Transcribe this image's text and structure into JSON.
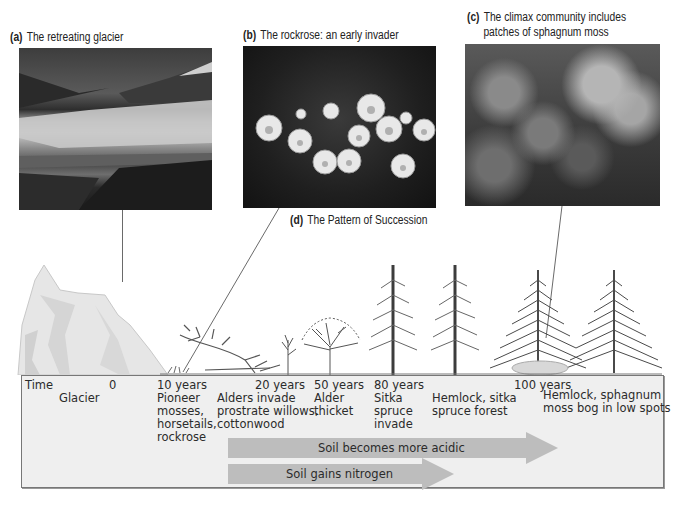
{
  "figure": {
    "panels": [
      {
        "letter": "(a)",
        "title": "The retreating glacier"
      },
      {
        "letter": "(b)",
        "title": "The rockrose: an early invader"
      },
      {
        "letter": "(c)",
        "title_line1": "The climax community includes",
        "title_line2": "patches of sphagnum moss"
      },
      {
        "letter": "(d)",
        "title": "The Pattern of Succession"
      }
    ],
    "timeline": {
      "time_label": "Time",
      "stages": [
        {
          "time": "0",
          "lines": [
            "Glacier"
          ]
        },
        {
          "time": "10 years",
          "lines": [
            "Pioneer",
            "mosses,",
            "horsetails,",
            "rockrose"
          ]
        },
        {
          "time": "20 years",
          "lines": [
            "Alders invade",
            "prostrate willows,",
            "cottonwood"
          ]
        },
        {
          "time": "50 years",
          "lines": [
            "Alder",
            "thicket"
          ]
        },
        {
          "time": "80 years",
          "lines": [
            "Sitka",
            "spruce",
            "invade"
          ]
        },
        {
          "time": "",
          "lines": [
            "Hemlock, sitka",
            "spruce forest"
          ]
        },
        {
          "time": "100 years",
          "lines": [
            "Hemlock, sphagnum",
            "moss bog in low spots"
          ]
        }
      ],
      "arrows": [
        {
          "label": "Soil becomes more acidic",
          "color": "#bdbdbd"
        },
        {
          "label": "Soil gains nitrogen",
          "color": "#bdbdbd"
        }
      ]
    },
    "colors": {
      "box_fill": "#efefef",
      "box_border": "#777777",
      "arrow_fill": "#bdbdbd",
      "glacier": "#e6e6e6"
    }
  }
}
